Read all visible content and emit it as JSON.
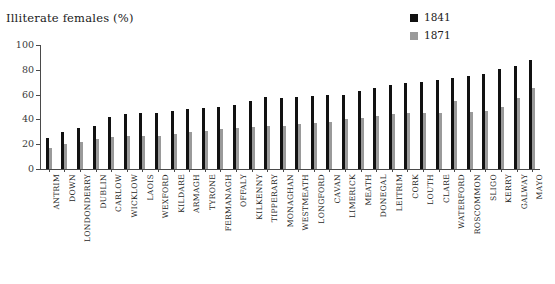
{
  "chart_data": {
    "type": "bar",
    "title": "Illiterate females (%)",
    "xlabel": "",
    "ylabel": "",
    "ylim": [
      0,
      100
    ],
    "yticks": [
      0,
      20,
      40,
      60,
      80,
      100
    ],
    "ytick_labels": [
      "0",
      "20",
      "40",
      "60",
      "80",
      "100"
    ],
    "grid": false,
    "legend_position": "top-right",
    "colors": {
      "1841": "#111111",
      "1871": "#9a9a9a"
    },
    "categories": [
      "ANTRIM",
      "DOWN",
      "LONDONDERRY",
      "DUBLIN",
      "CARLOW",
      "WICKLOW",
      "LAOIS",
      "WEXFORD",
      "KILDARE",
      "ARMAGH",
      "TYRONE",
      "FERMANAGH",
      "OFFALY",
      "KILKENNY",
      "TIPPERARY",
      "MONAGHAN",
      "WESTMEATH",
      "LONGFORD",
      "CAVAN",
      "LIMERICK",
      "MEATH",
      "DONEGAL",
      "LEITRIM",
      "CORK",
      "LOUTH",
      "CLARE",
      "WATERFORD",
      "ROSCOMMON",
      "SLIGO",
      "KERRY",
      "GALWAY",
      "MAYO"
    ],
    "series": [
      {
        "name": "1841",
        "color": "#111111",
        "values": [
          25,
          30,
          33,
          35,
          42,
          44,
          45,
          45,
          47,
          48,
          49,
          50,
          52,
          55,
          58,
          57,
          58,
          59,
          60,
          60,
          63,
          65,
          68,
          69,
          70,
          72,
          73,
          75,
          77,
          81,
          83,
          88
        ]
      },
      {
        "name": "1871",
        "color": "#9a9a9a",
        "values": [
          17,
          20,
          22,
          24,
          26,
          27,
          27,
          27,
          28,
          30,
          31,
          32,
          33,
          34,
          35,
          35,
          36,
          37,
          38,
          40,
          41,
          43,
          44,
          45,
          45,
          45,
          55,
          46,
          47,
          50,
          57,
          65
        ]
      }
    ]
  },
  "legend": {
    "entries": [
      {
        "label": "1841",
        "swatch": "legend-swatch-1841"
      },
      {
        "label": "1871",
        "swatch": "legend-swatch-1871"
      }
    ]
  }
}
